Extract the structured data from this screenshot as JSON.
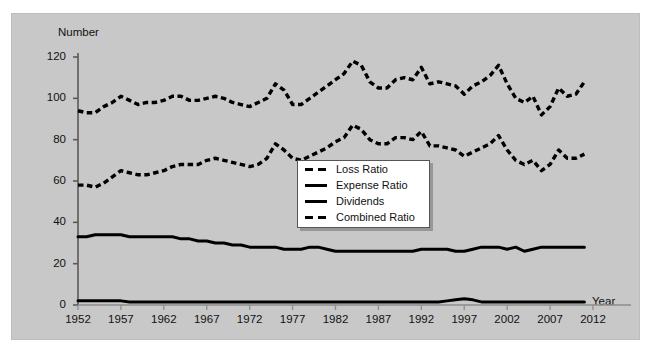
{
  "figure": {
    "background": "#c8c8c8",
    "page_background": "#ffffff",
    "line_color": "#000000"
  },
  "axes": {
    "ylabel": "Number",
    "xlabel": "Year",
    "y_ticks": [
      "0",
      "20",
      "40",
      "60",
      "80",
      "100",
      "120"
    ],
    "x_ticks": [
      "1952",
      "1957",
      "1962",
      "1967",
      "1972",
      "1977",
      "1982",
      "1987",
      "1992",
      "1997",
      "2002",
      "2007",
      "2012"
    ]
  },
  "legend": {
    "items": [
      {
        "label": "Loss Ratio",
        "style": "dashed"
      },
      {
        "label": "Expense Ratio",
        "style": "solid"
      },
      {
        "label": "Dividends",
        "style": "solid"
      },
      {
        "label": "Combined Ratio",
        "style": "dashed"
      }
    ]
  },
  "chart_data": {
    "type": "line",
    "title": "",
    "xlabel": "Year",
    "ylabel": "Number",
    "xlim": [
      1952,
      2012
    ],
    "ylim": [
      0,
      120
    ],
    "grid": false,
    "legend_position": "center",
    "x": [
      1952,
      1953,
      1954,
      1955,
      1956,
      1957,
      1958,
      1959,
      1960,
      1961,
      1962,
      1963,
      1964,
      1965,
      1966,
      1967,
      1968,
      1969,
      1970,
      1971,
      1972,
      1973,
      1974,
      1975,
      1976,
      1977,
      1978,
      1979,
      1980,
      1981,
      1982,
      1983,
      1984,
      1985,
      1986,
      1987,
      1988,
      1989,
      1990,
      1991,
      1992,
      1993,
      1994,
      1995,
      1996,
      1997,
      1998,
      1999,
      2000,
      2001,
      2002,
      2003,
      2004,
      2005,
      2006,
      2007,
      2008,
      2009,
      2010,
      2011
    ],
    "series": [
      {
        "name": "Combined Ratio",
        "style": "dashed",
        "values": [
          94,
          93,
          93,
          96,
          98,
          101,
          99,
          97,
          98,
          98,
          99,
          101,
          101,
          99,
          99,
          100,
          101,
          100,
          98,
          97,
          96,
          98,
          100,
          107,
          104,
          97,
          97,
          100,
          103,
          106,
          109,
          112,
          118,
          116,
          108,
          105,
          105,
          109,
          110,
          109,
          115,
          107,
          108,
          107,
          106,
          102,
          106,
          108,
          111,
          116,
          107,
          100,
          98,
          101,
          92,
          96,
          105,
          101,
          102,
          108
        ],
        "ylim": [
          0,
          120
        ]
      },
      {
        "name": "Loss Ratio",
        "style": "dashed",
        "values": [
          58,
          58,
          57,
          59,
          62,
          65,
          64,
          63,
          63,
          64,
          65,
          67,
          68,
          68,
          68,
          70,
          71,
          70,
          69,
          68,
          67,
          68,
          71,
          78,
          75,
          71,
          70,
          72,
          74,
          76,
          79,
          81,
          87,
          85,
          80,
          78,
          78,
          81,
          81,
          80,
          84,
          77,
          77,
          76,
          75,
          72,
          74,
          76,
          78,
          82,
          75,
          70,
          68,
          70,
          65,
          68,
          75,
          71,
          71,
          73
        ],
        "ylim": [
          0,
          120
        ]
      },
      {
        "name": "Expense Ratio",
        "style": "solid",
        "values": [
          33,
          33,
          34,
          34,
          34,
          34,
          33,
          33,
          33,
          33,
          33,
          33,
          32,
          32,
          31,
          31,
          30,
          30,
          29,
          29,
          28,
          28,
          28,
          28,
          27,
          27,
          27,
          28,
          28,
          27,
          26,
          26,
          26,
          26,
          26,
          26,
          26,
          26,
          26,
          26,
          27,
          27,
          27,
          27,
          26,
          26,
          27,
          28,
          28,
          28,
          27,
          28,
          26,
          27,
          28,
          28,
          28,
          28,
          28,
          28
        ],
        "ylim": [
          0,
          120
        ]
      },
      {
        "name": "Dividends",
        "style": "solid",
        "values": [
          2,
          2,
          2,
          2,
          2,
          2,
          1.5,
          1.5,
          1.5,
          1.5,
          1.5,
          1.5,
          1.5,
          1.5,
          1.5,
          1.5,
          1.5,
          1.5,
          1.5,
          1.5,
          1.5,
          1.5,
          1.5,
          1.5,
          1.5,
          1.5,
          1.5,
          1.5,
          1.5,
          1.5,
          1.5,
          1.5,
          1.5,
          1.5,
          1.5,
          1.5,
          1.5,
          1.5,
          1.5,
          1.5,
          1.5,
          1.5,
          1.5,
          2,
          2.5,
          3,
          2.5,
          1.5,
          1.5,
          1.5,
          1.5,
          1.5,
          1.5,
          1.5,
          1.5,
          1.5,
          1.5,
          1.5,
          1.5,
          1.5
        ],
        "ylim": [
          0,
          120
        ]
      }
    ]
  }
}
